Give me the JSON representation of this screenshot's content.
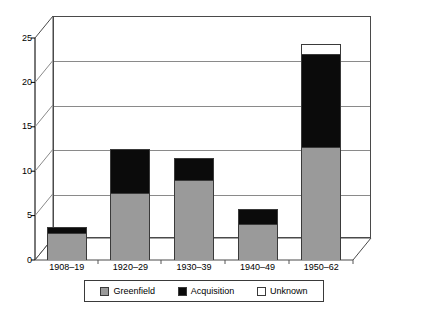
{
  "chart_data": {
    "type": "bar",
    "subtype": "stacked-bar-3d",
    "title": "",
    "subtitle": "",
    "xlabel": "",
    "ylabel": "",
    "categories": [
      "1908–19",
      "1920–29",
      "1930–39",
      "1940–49",
      "1950–62"
    ],
    "series": [
      {
        "name": "Greenfield",
        "color": "#9a9a9a",
        "values": [
          3.0,
          7.5,
          9.0,
          4.0,
          12.7
        ]
      },
      {
        "name": "Acquisition",
        "color": "#0b0b0b",
        "values": [
          0.7,
          5.0,
          2.5,
          1.8,
          10.5
        ]
      },
      {
        "name": "Unknown",
        "color": "#ffffff",
        "values": [
          0.0,
          0.0,
          0.0,
          0.0,
          1.1
        ]
      }
    ],
    "totals": [
      3.7,
      12.5,
      11.5,
      5.8,
      24.3
    ],
    "ylim": [
      0,
      25
    ],
    "yticks": [
      0,
      5,
      10,
      15,
      20,
      25
    ],
    "ytick_labels": [
      "0",
      "5",
      "10",
      "15",
      "20",
      "25"
    ],
    "grid": true,
    "grid_axis": "y",
    "legend": [
      "Greenfield",
      "Acquisition",
      "Unknown"
    ],
    "legend_position": "bottom"
  },
  "axis": {
    "y_tick_labels": [
      "25",
      "20",
      "15",
      "10",
      "5",
      "0"
    ]
  },
  "legend": {
    "items": [
      {
        "label": "Greenfield"
      },
      {
        "label": "Acquisition"
      },
      {
        "label": "Unknown"
      }
    ]
  }
}
